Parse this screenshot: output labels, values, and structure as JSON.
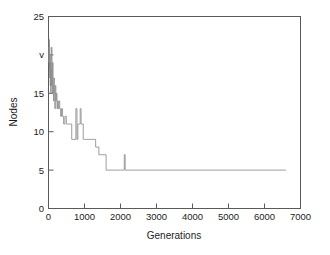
{
  "chart_data": {
    "type": "line",
    "title": "",
    "subtitle": "",
    "xlabel": "Generations",
    "ylabel": "Nodes",
    "xlim": [
      0,
      7000
    ],
    "ylim": [
      0,
      25
    ],
    "grid": false,
    "legend": null,
    "xticks": [
      0,
      1000,
      2000,
      3000,
      4000,
      5000,
      6000,
      7000
    ],
    "xtick_labels": [
      "0",
      "1000",
      "2000",
      "3000",
      "4000",
      "5000",
      "6000",
      "7000"
    ],
    "yticks": [
      0,
      5,
      10,
      15,
      20,
      25
    ],
    "ytick_labels": [
      "0",
      "5",
      "10",
      "v",
      "15",
      "20",
      "25"
    ],
    "ytick_labels_rendered": [
      "0",
      "5",
      "10",
      "15",
      "v",
      "25"
    ],
    "line_color": "#8d8d8d",
    "axis_color": "#5a5a5a",
    "series": [
      {
        "name": "best individual size",
        "step": "post",
        "x": [
          0,
          10,
          18,
          24,
          30,
          36,
          42,
          48,
          55,
          62,
          70,
          78,
          86,
          95,
          105,
          115,
          126,
          138,
          150,
          163,
          176,
          190,
          205,
          220,
          236,
          252,
          270,
          290,
          312,
          336,
          362,
          390,
          420,
          455,
          495,
          540,
          590,
          645,
          700,
          740,
          760,
          790,
          815,
          835,
          855,
          880,
          905,
          930,
          950,
          965,
          985,
          1000,
          1025,
          1060,
          1100,
          1160,
          1230,
          1310,
          1400,
          1480,
          1560,
          1600,
          2080,
          2105,
          2130,
          6600
        ],
        "y": [
          21,
          19,
          22,
          18,
          21,
          17,
          20,
          16,
          19,
          15,
          18,
          16,
          21,
          17,
          15,
          19,
          16,
          14,
          17,
          15,
          13,
          16,
          14,
          15,
          13,
          14,
          13,
          14,
          13,
          12,
          13,
          12,
          11,
          12,
          11,
          11,
          11,
          9,
          9,
          9,
          13,
          9,
          11,
          11,
          11,
          13,
          11,
          11,
          11,
          9,
          9,
          9,
          9,
          9,
          9,
          9,
          9,
          8,
          7,
          7,
          7,
          5,
          5,
          7,
          5,
          5
        ]
      }
    ],
    "annotations": [
      {
        "text": "curve decreases monotonically in steps from about 21 nodes to a stable plateau of 5 nodes"
      },
      {
        "text": "isolated spike to 7 nodes near generation 2100"
      },
      {
        "text": "two narrow spikes to 13 nodes near generations 760 and 880"
      },
      {
        "text": "line terminates near generation 6600"
      }
    ]
  },
  "axes": {
    "y_title": "Nodes",
    "x_title": "Generations"
  }
}
